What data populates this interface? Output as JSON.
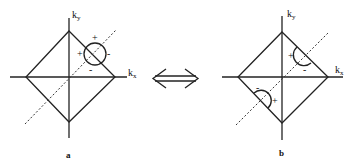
{
  "figure": {
    "panels": [
      {
        "id": "a",
        "caption": "a",
        "axis_x_label": "k",
        "axis_x_sub": "x",
        "axis_y_label": "k",
        "axis_y_sub": "y",
        "marker_type": "full-circle",
        "signs": [
          "+",
          "+",
          "-",
          "-"
        ]
      },
      {
        "id": "b",
        "caption": "b",
        "axis_x_label": "k",
        "axis_x_sub": "x",
        "axis_y_label": "k",
        "axis_y_sub": "y",
        "marker_type": "half-circles",
        "signs_upper": [
          "+",
          "-"
        ],
        "signs_lower": [
          "-",
          "+"
        ]
      }
    ],
    "relation_symbol": "double-arrow"
  }
}
